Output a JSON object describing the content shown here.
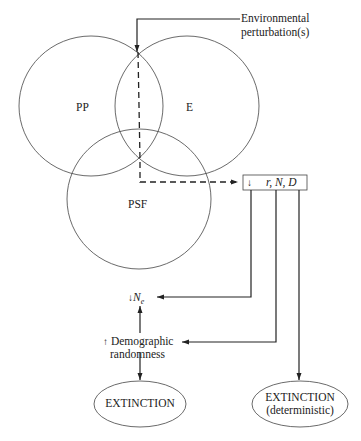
{
  "diagram": {
    "circles": [
      {
        "id": "pp",
        "label": "PP"
      },
      {
        "id": "e",
        "label": "E"
      },
      {
        "id": "psf",
        "label": "PSF"
      }
    ],
    "input": {
      "label_line1": "Environmental",
      "label_line2": "perturbation(s)"
    },
    "box": {
      "arrow": "↓",
      "label": "r, N, D"
    },
    "ne": {
      "arrow": "↓",
      "label": "N",
      "subscript": "e"
    },
    "demographic": {
      "arrow": "↑",
      "label_line1": "Demographic",
      "label_line2": "randomness"
    },
    "extinction_left": {
      "label": "EXTINCTION"
    },
    "extinction_right": {
      "label_line1": "EXTINCTION",
      "label_line2": "(deterministic)"
    },
    "colors": {
      "line": "#222222",
      "background": "#ffffff"
    }
  }
}
